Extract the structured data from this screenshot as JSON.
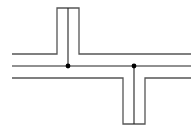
{
  "diagram": {
    "width": 196,
    "height": 134,
    "background": "#ffffff",
    "outline_color": "#555555",
    "center_color": "#222222",
    "node_color": "#000000",
    "outer_stroke_width": 1.3,
    "center_stroke_width": 1.1,
    "node_radius": 2.4,
    "channel": {
      "left_x": 12,
      "right_x": 191,
      "top_y": 54,
      "center_y": 66,
      "bottom_y": 78
    },
    "upper_branch": {
      "left_x": 57,
      "center_x": 68,
      "right_x": 79,
      "end_y": 8
    },
    "lower_branch": {
      "left_x": 123,
      "center_x": 134,
      "right_x": 145,
      "end_y": 124
    },
    "nodes": [
      {
        "x": 68,
        "y": 66
      },
      {
        "x": 134,
        "y": 66
      }
    ]
  }
}
